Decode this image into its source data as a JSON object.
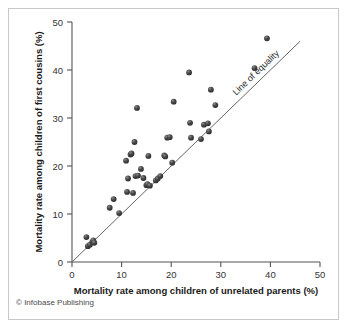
{
  "credit": {
    "symbol": "©",
    "text": "Infobase Publishing"
  },
  "annotations": {
    "line_of_equality": "Line of equality"
  },
  "colors": {
    "marker": "#3a3a3a",
    "axis": "#555555",
    "text": "#1a1a1a",
    "frame": "#c8c8c8",
    "equality_line": "#666666",
    "background": "#ffffff"
  },
  "chart_data": {
    "type": "scatter",
    "title": "",
    "xlabel": "Mortality rate among children of unrelated parents (%)",
    "ylabel": "Mortality rate among children of first cousins (%)",
    "xlim": [
      0,
      50
    ],
    "ylim": [
      0,
      50
    ],
    "xticks": [
      0,
      10,
      20,
      30,
      40,
      50
    ],
    "yticks": [
      0,
      10,
      20,
      30,
      40,
      50
    ],
    "xticklabels": [
      "0",
      "10",
      "20",
      "30",
      "40",
      "50"
    ],
    "yticklabels": [
      "0",
      "10",
      "20",
      "30",
      "40",
      "50"
    ],
    "grid": false,
    "legend": null,
    "reference_line": {
      "label": "Line of equality",
      "from": [
        0,
        0
      ],
      "to": [
        46,
        46
      ],
      "slope": 1,
      "intercept": 0
    },
    "series": [
      {
        "name": "Countries",
        "marker": "filled-circle",
        "points": [
          [
            2.9,
            5.2
          ],
          [
            3.2,
            3.3
          ],
          [
            3.6,
            3.6
          ],
          [
            4.1,
            4.2
          ],
          [
            4.3,
            4.5
          ],
          [
            4.5,
            4.0
          ],
          [
            7.6,
            11.3
          ],
          [
            8.4,
            13.1
          ],
          [
            9.5,
            10.2
          ],
          [
            10.9,
            21.1
          ],
          [
            11.1,
            14.6
          ],
          [
            11.3,
            17.4
          ],
          [
            11.8,
            22.4
          ],
          [
            12.0,
            22.6
          ],
          [
            12.3,
            14.4
          ],
          [
            12.6,
            25.0
          ],
          [
            12.8,
            17.9
          ],
          [
            13.1,
            32.1
          ],
          [
            13.3,
            18.0
          ],
          [
            13.9,
            19.4
          ],
          [
            14.4,
            17.5
          ],
          [
            15.0,
            16.0
          ],
          [
            15.2,
            16.2
          ],
          [
            15.4,
            22.1
          ],
          [
            15.7,
            15.9
          ],
          [
            16.9,
            17.0
          ],
          [
            17.3,
            17.4
          ],
          [
            17.8,
            17.9
          ],
          [
            18.6,
            22.2
          ],
          [
            18.8,
            22.0
          ],
          [
            19.2,
            25.9
          ],
          [
            19.7,
            26.0
          ],
          [
            20.2,
            20.7
          ],
          [
            20.5,
            33.4
          ],
          [
            23.6,
            39.5
          ],
          [
            23.8,
            29.0
          ],
          [
            24.0,
            25.9
          ],
          [
            26.0,
            25.6
          ],
          [
            26.6,
            28.6
          ],
          [
            27.4,
            28.9
          ],
          [
            27.6,
            27.2
          ],
          [
            28.0,
            35.9
          ],
          [
            28.9,
            32.7
          ],
          [
            36.8,
            40.4
          ],
          [
            39.3,
            46.6
          ]
        ]
      }
    ]
  }
}
